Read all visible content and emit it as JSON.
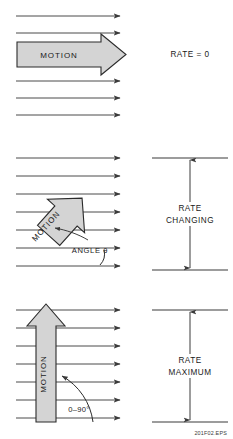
{
  "figure": {
    "id_label": "201F02.EPS",
    "panels": [
      {
        "key": "parallel",
        "motion_label": "MOTION",
        "rate_label": "RATE = 0",
        "flow_arrow_count": 6,
        "motion_direction": "horizontal-right",
        "angle_label": ""
      },
      {
        "key": "diagonal",
        "motion_label": "MOTION",
        "rate_label_line1": "RATE",
        "rate_label_line2": "CHANGING",
        "angle_label": "ANGLE θ",
        "flow_arrow_count": 7,
        "motion_direction": "diagonal-up-right"
      },
      {
        "key": "perpendicular",
        "motion_label": "MOTION",
        "rate_label_line1": "RATE",
        "rate_label_line2": "MAXIMUM",
        "angle_label": "0–90°",
        "flow_arrow_count": 7,
        "motion_direction": "vertical-up"
      }
    ]
  },
  "colors": {
    "arrow_fill": "#d4d4d4",
    "arrow_stroke": "#2b2b2b",
    "flow_stroke": "#4a4a4a",
    "text": "#1a1a1a",
    "background": "#ffffff"
  }
}
